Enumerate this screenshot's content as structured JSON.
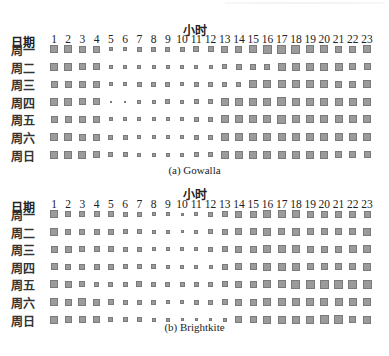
{
  "chart_data": [
    {
      "type": "heatmap",
      "title": "(a) Gowalla",
      "xlabel": "小时",
      "ylabel": "日期",
      "x": [
        1,
        2,
        3,
        4,
        5,
        6,
        7,
        8,
        9,
        10,
        11,
        12,
        13,
        14,
        15,
        16,
        17,
        18,
        19,
        20,
        21,
        22,
        23
      ],
      "y": [
        "周一",
        "周二",
        "周三",
        "周四",
        "周五",
        "周六",
        "周日"
      ],
      "encoding": "square size (px) proportional to activity",
      "values": [
        [
          8,
          8,
          7,
          7,
          4,
          4,
          5,
          5,
          5,
          5,
          6,
          6,
          7,
          7,
          8,
          9,
          9,
          9,
          8,
          8,
          7,
          7,
          8
        ],
        [
          8,
          8,
          7,
          7,
          4,
          4,
          4,
          4,
          4,
          4,
          4,
          4,
          5,
          6,
          6,
          6,
          8,
          8,
          8,
          8,
          8,
          7,
          7
        ],
        [
          7,
          7,
          7,
          7,
          4,
          4,
          5,
          5,
          5,
          4,
          5,
          5,
          5,
          5,
          8,
          8,
          8,
          8,
          8,
          8,
          7,
          7,
          8
        ],
        [
          8,
          8,
          7,
          7,
          2,
          2,
          4,
          4,
          5,
          4,
          5,
          5,
          8,
          8,
          8,
          8,
          9,
          8,
          8,
          8,
          8,
          8,
          8
        ],
        [
          7,
          7,
          7,
          7,
          4,
          4,
          4,
          4,
          4,
          4,
          5,
          5,
          8,
          8,
          8,
          8,
          9,
          8,
          8,
          8,
          8,
          8,
          8
        ],
        [
          8,
          8,
          7,
          7,
          5,
          5,
          4,
          4,
          4,
          4,
          5,
          5,
          8,
          8,
          8,
          8,
          8,
          8,
          8,
          8,
          8,
          8,
          8
        ],
        [
          8,
          8,
          8,
          7,
          5,
          5,
          4,
          4,
          4,
          4,
          5,
          5,
          8,
          8,
          8,
          8,
          8,
          8,
          8,
          8,
          7,
          7,
          7
        ]
      ]
    },
    {
      "type": "heatmap",
      "title": "(b) Brightkite",
      "xlabel": "小时",
      "ylabel": "日期",
      "x": [
        1,
        2,
        3,
        4,
        5,
        6,
        7,
        8,
        9,
        10,
        11,
        12,
        13,
        14,
        15,
        16,
        17,
        18,
        19,
        20,
        21,
        22,
        23
      ],
      "y": [
        "周一",
        "周二",
        "周三",
        "周四",
        "周五",
        "周六",
        "周日"
      ],
      "encoding": "square size (px) proportional to activity",
      "values": [
        [
          8,
          6,
          6,
          6,
          6,
          5,
          5,
          4,
          4,
          3,
          4,
          5,
          6,
          7,
          7,
          8,
          8,
          8,
          7,
          7,
          7,
          7,
          7
        ],
        [
          8,
          6,
          6,
          6,
          6,
          5,
          5,
          4,
          4,
          3,
          4,
          5,
          6,
          7,
          7,
          8,
          7,
          8,
          7,
          7,
          7,
          7,
          8
        ],
        [
          7,
          7,
          6,
          6,
          6,
          5,
          5,
          4,
          4,
          4,
          4,
          5,
          6,
          7,
          7,
          8,
          8,
          8,
          7,
          7,
          7,
          8,
          8
        ],
        [
          7,
          6,
          6,
          6,
          6,
          5,
          5,
          5,
          4,
          4,
          4,
          4,
          6,
          7,
          7,
          8,
          8,
          8,
          7,
          7,
          7,
          7,
          8
        ],
        [
          8,
          7,
          6,
          5,
          5,
          5,
          6,
          5,
          5,
          5,
          5,
          5,
          6,
          7,
          7,
          8,
          8,
          9,
          9,
          9,
          9,
          9,
          9
        ],
        [
          8,
          7,
          8,
          7,
          6,
          5,
          5,
          5,
          4,
          4,
          5,
          5,
          6,
          7,
          7,
          8,
          8,
          8,
          8,
          8,
          8,
          8,
          8
        ],
        [
          8,
          7,
          7,
          7,
          5,
          5,
          5,
          4,
          4,
          3,
          3,
          3,
          4,
          7,
          7,
          8,
          8,
          8,
          8,
          9,
          9,
          7,
          8
        ]
      ]
    }
  ],
  "panels": [
    {
      "hour_title": "小时",
      "day_header": "日期",
      "caption": "(a) Gowalla"
    },
    {
      "hour_title": "小时",
      "day_header": "日期",
      "caption": "(b) Brightkite"
    }
  ],
  "colors": {
    "cell_fill": "#9b9b9b",
    "cell_border": "#7a7a7a",
    "text": "#222222"
  }
}
